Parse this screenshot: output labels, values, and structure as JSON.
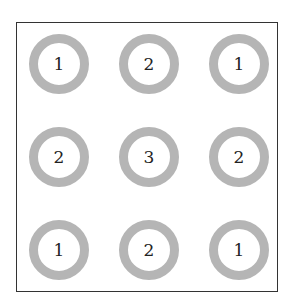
{
  "diagram": {
    "grid": [
      [
        1,
        2,
        1
      ],
      [
        2,
        3,
        2
      ],
      [
        1,
        2,
        1
      ]
    ],
    "labels": [
      "1",
      "2",
      "1",
      "2",
      "3",
      "2",
      "1",
      "2",
      "1"
    ],
    "ring_color": "#b5b5b5",
    "frame_color": "#333333"
  }
}
